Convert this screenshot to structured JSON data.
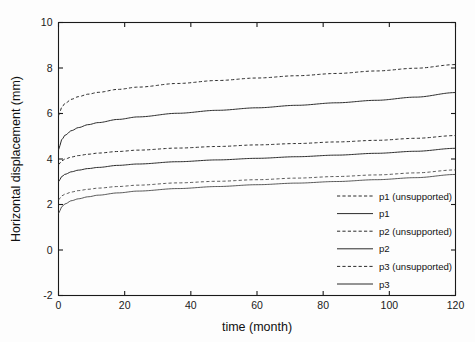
{
  "chart_data": {
    "type": "line",
    "title": "",
    "xlabel": "time (month)",
    "ylabel": "Horizontal displacement  (mm)",
    "xlim": [
      0,
      120
    ],
    "ylim": [
      -2,
      10
    ],
    "xticks": [
      0,
      20,
      40,
      60,
      80,
      100,
      120
    ],
    "yticks": [
      -2,
      0,
      2,
      4,
      6,
      8,
      10
    ],
    "xticklabels": [
      "0",
      "20",
      "40",
      "60",
      "80",
      "100",
      "120"
    ],
    "yticklabels": [
      "-2",
      "0",
      "2",
      "4",
      "6",
      "8",
      "10"
    ],
    "grid": false,
    "legend_position": "lower right",
    "x": [
      0,
      1,
      2,
      4,
      6,
      9,
      12,
      18,
      24,
      36,
      48,
      60,
      72,
      84,
      96,
      108,
      120
    ],
    "series": [
      {
        "name": "p1 (unsupported)",
        "style": "dashed",
        "values": [
          5.9,
          6.28,
          6.45,
          6.63,
          6.74,
          6.85,
          6.93,
          7.06,
          7.16,
          7.32,
          7.45,
          7.56,
          7.66,
          7.76,
          7.87,
          7.99,
          8.15
        ]
      },
      {
        "name": "p1",
        "style": "solid",
        "values": [
          4.4,
          4.85,
          5.05,
          5.25,
          5.38,
          5.51,
          5.6,
          5.74,
          5.85,
          6.01,
          6.14,
          6.25,
          6.36,
          6.47,
          6.58,
          6.72,
          6.92
        ]
      },
      {
        "name": "p2 (unsupported)",
        "style": "dashed",
        "values": [
          3.75,
          3.92,
          4.0,
          4.09,
          4.15,
          4.21,
          4.26,
          4.33,
          4.39,
          4.48,
          4.55,
          4.62,
          4.68,
          4.75,
          4.82,
          4.91,
          5.03
        ]
      },
      {
        "name": "p2",
        "style": "solid",
        "values": [
          3.0,
          3.23,
          3.33,
          3.44,
          3.51,
          3.58,
          3.63,
          3.72,
          3.78,
          3.88,
          3.96,
          4.03,
          4.1,
          4.17,
          4.25,
          4.34,
          4.47
        ]
      },
      {
        "name": "p3 (unsupported)",
        "style": "dashed-thin",
        "values": [
          2.2,
          2.38,
          2.46,
          2.55,
          2.61,
          2.67,
          2.72,
          2.79,
          2.85,
          2.95,
          3.02,
          3.09,
          3.16,
          3.23,
          3.3,
          3.39,
          3.52
        ]
      },
      {
        "name": "p3",
        "style": "solid-thin",
        "values": [
          1.6,
          1.9,
          2.03,
          2.17,
          2.25,
          2.34,
          2.41,
          2.51,
          2.59,
          2.7,
          2.79,
          2.87,
          2.94,
          3.01,
          3.09,
          3.18,
          3.32
        ]
      }
    ]
  },
  "legend": {
    "entries": [
      {
        "label": "p1 (unsupported)",
        "style": "dashed"
      },
      {
        "label": "p1",
        "style": "solid"
      },
      {
        "label": "p2 (unsupported)",
        "style": "dashed"
      },
      {
        "label": "p2",
        "style": "solid"
      },
      {
        "label": "p3 (unsupported)",
        "style": "dashed"
      },
      {
        "label": "p3",
        "style": "solid"
      }
    ]
  }
}
